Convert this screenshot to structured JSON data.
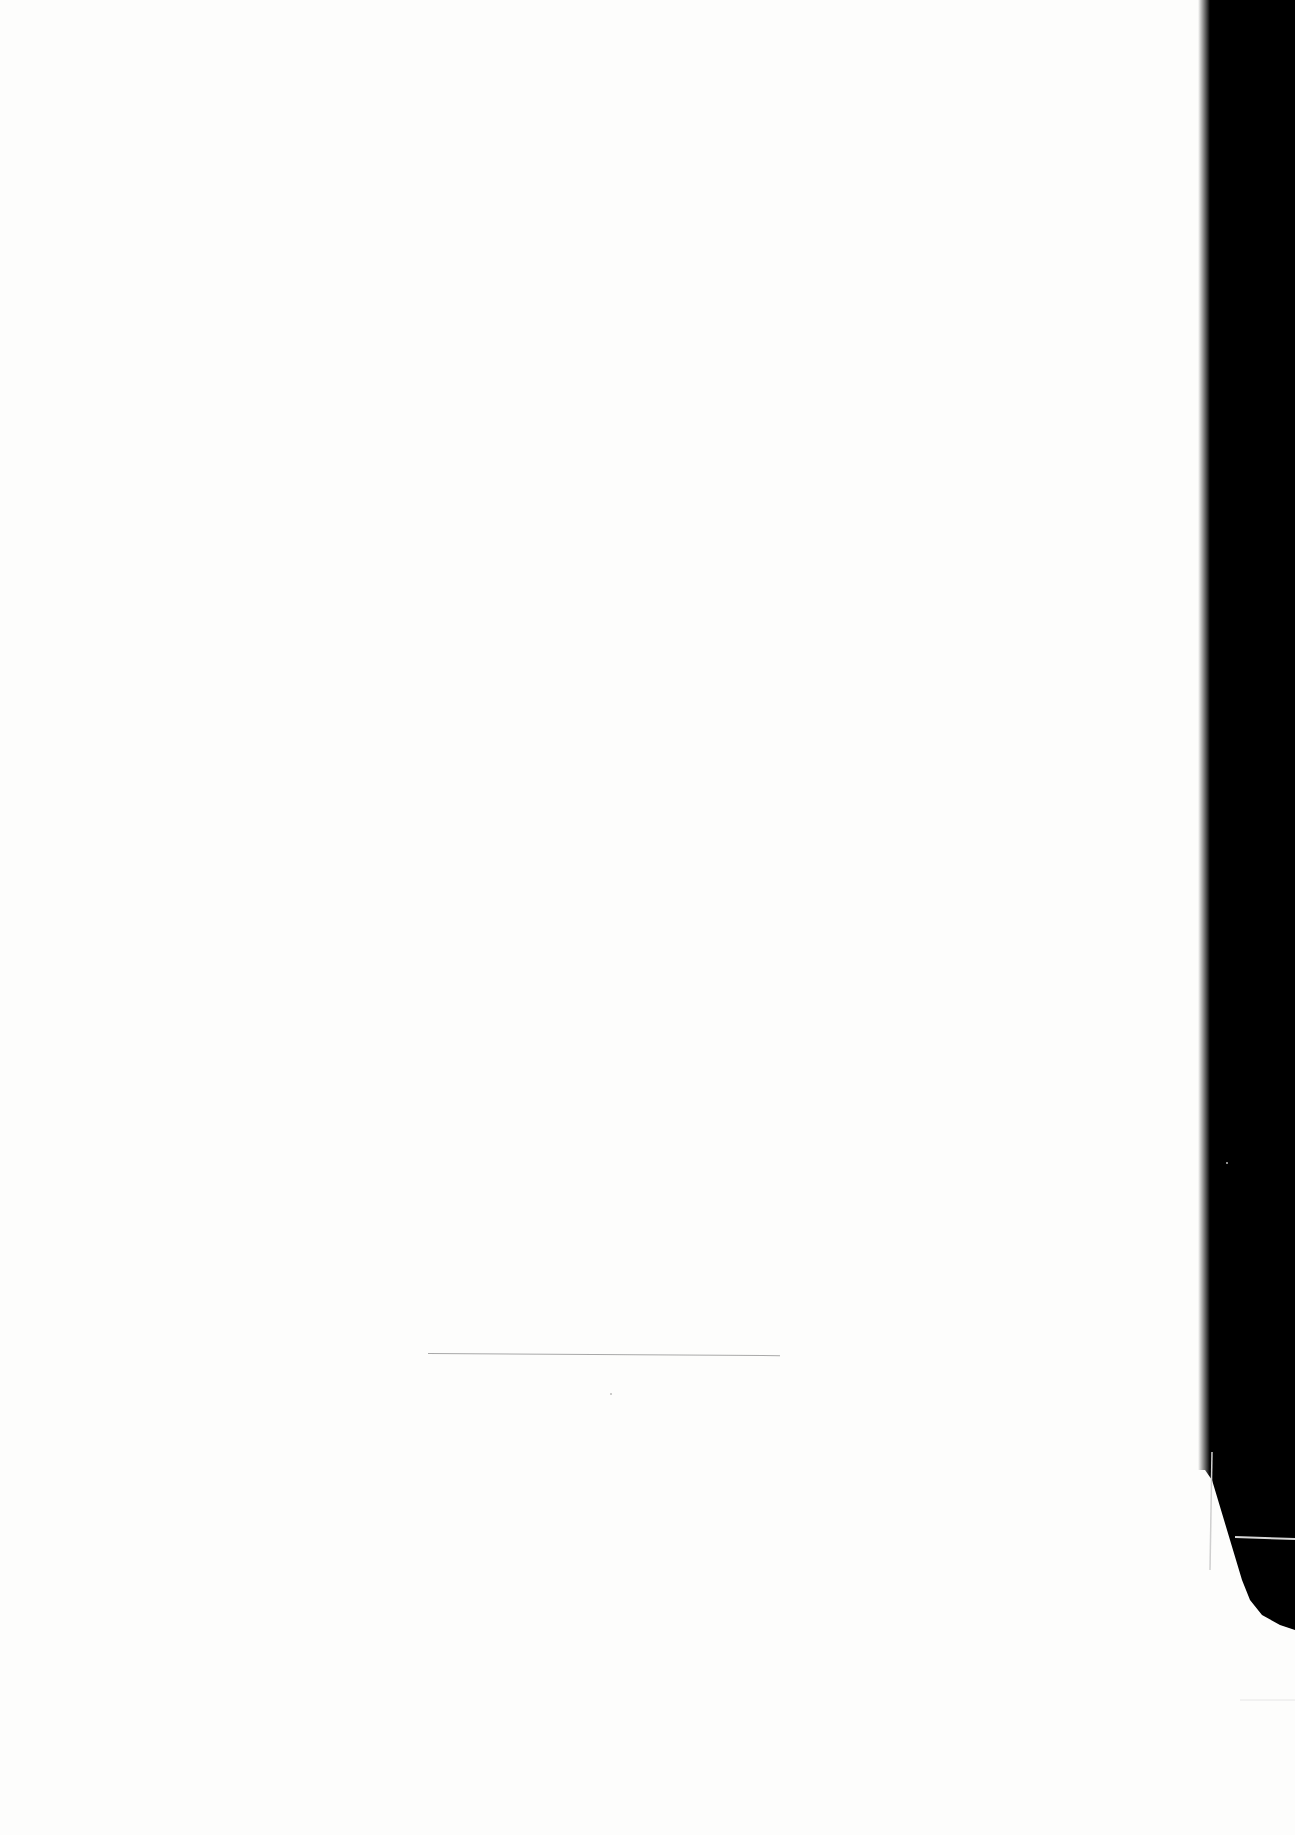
{
  "document": {
    "type": "scanned-page",
    "content": "blank",
    "paper_color": "#fdfdfc",
    "scanner_background_color": "#000000",
    "rule_color": "#a8a8a8",
    "text": ""
  }
}
